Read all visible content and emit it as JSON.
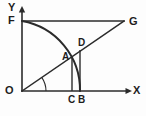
{
  "figure": {
    "background_color": "#fdfdfd",
    "ink_color": "#2b2b2b",
    "width": 146,
    "height": 116,
    "labels": {
      "y_axis": "Y",
      "x_axis": "X",
      "origin": "O",
      "point_f": "F",
      "point_g": "G",
      "point_a": "A",
      "point_b": "B",
      "point_c": "C",
      "point_d": "D"
    },
    "geometry": {
      "origin": {
        "x": 22,
        "y": 91
      },
      "y_axis_top": {
        "x": 22,
        "y": 9
      },
      "x_axis_right": {
        "x": 131,
        "y": 91
      },
      "point_f": {
        "x": 22,
        "y": 21
      },
      "point_g": {
        "x": 124,
        "y": 21
      },
      "point_b": {
        "x": 80,
        "y": 91
      },
      "point_c": {
        "x": 72,
        "y": 91
      },
      "point_a": {
        "x": 72,
        "y": 57
      },
      "point_d": {
        "x": 80,
        "y": 50
      },
      "arc_radius": 70,
      "angle_arc_radius": 24,
      "ray_angle_degrees": 34
    },
    "elements": [
      "y-axis",
      "x-axis",
      "segment-FG",
      "ray-OG",
      "quarter-arc-FB",
      "segment-AC",
      "segment-DB",
      "angle-marker-at-O"
    ]
  }
}
